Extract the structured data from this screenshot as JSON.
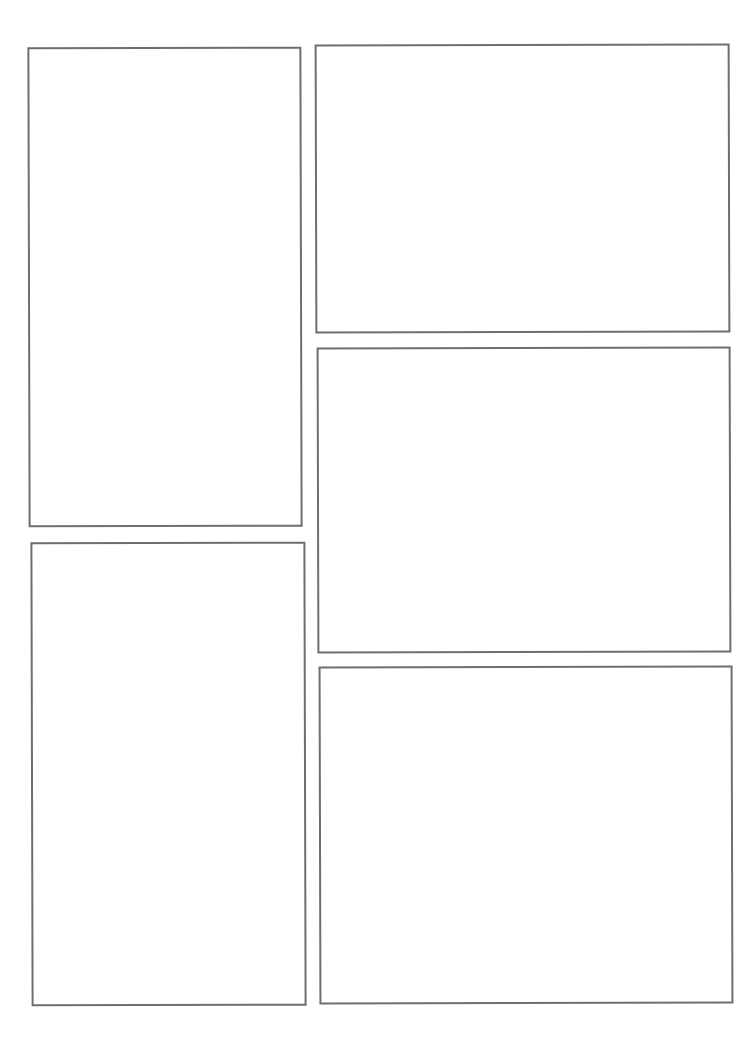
{
  "page": {
    "type": "comic-panel-template",
    "background": "#ffffff",
    "border_color": "#6e6e6e",
    "panel_count": 5
  },
  "panels": [
    {
      "id": "panel-1",
      "left": 28,
      "top": 47,
      "width": 274,
      "height": 480,
      "rotate": -0.15
    },
    {
      "id": "panel-2",
      "left": 315,
      "top": 44,
      "width": 415,
      "height": 289,
      "rotate": -0.15
    },
    {
      "id": "panel-3",
      "left": 317,
      "top": 347,
      "width": 414,
      "height": 306,
      "rotate": -0.15
    },
    {
      "id": "panel-4",
      "left": 31,
      "top": 542,
      "width": 275,
      "height": 464,
      "rotate": -0.15
    },
    {
      "id": "panel-5",
      "left": 319,
      "top": 666,
      "width": 414,
      "height": 338,
      "rotate": -0.15
    }
  ]
}
